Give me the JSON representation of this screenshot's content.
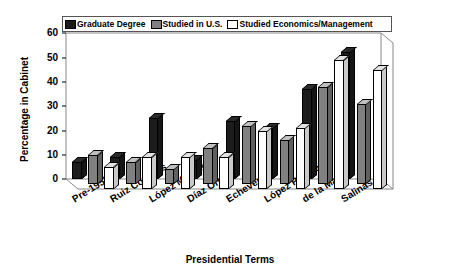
{
  "chart_data": {
    "type": "bar",
    "title": "",
    "xlabel": "Presidential Terms",
    "ylabel": "Percentage in Cabinet",
    "categories": [
      "Pre-1952",
      "Ruiz Cortines",
      "López Mateos",
      "Díaz Ordaz",
      "Echeverría",
      "López Portilo",
      "de la Madrid",
      "Salinas"
    ],
    "series": [
      {
        "name": "Graduate Degree",
        "color": "#1c1c1c",
        "values": [
          7,
          9,
          25,
          8,
          24,
          21,
          37,
          52
        ]
      },
      {
        "name": "Studied in U.S.",
        "color": "#808080",
        "values": [
          12,
          9,
          6,
          15,
          24,
          18,
          40,
          33
        ]
      },
      {
        "name": "Studied Economics/Management",
        "color": "#ffffff",
        "values": [
          9,
          13,
          13,
          13,
          24,
          25,
          53,
          49
        ]
      }
    ],
    "ylim": [
      0,
      60
    ],
    "yticks": [
      "0",
      "10",
      "20",
      "30",
      "40",
      "50",
      "60"
    ],
    "grid": false,
    "legend_position": "top"
  },
  "legend": {
    "items": [
      {
        "label": "Graduate Degree",
        "color": "#1c1c1c"
      },
      {
        "label": "Studied in U.S.",
        "color": "#808080"
      },
      {
        "label": "Studied Economics/Management",
        "color": "#ffffff"
      }
    ]
  },
  "axes": {
    "y_title": "Percentage in Cabinet",
    "x_title": "Presidential Terms",
    "y_ticks": [
      "60",
      "50",
      "40",
      "30",
      "20",
      "10",
      "0"
    ]
  }
}
